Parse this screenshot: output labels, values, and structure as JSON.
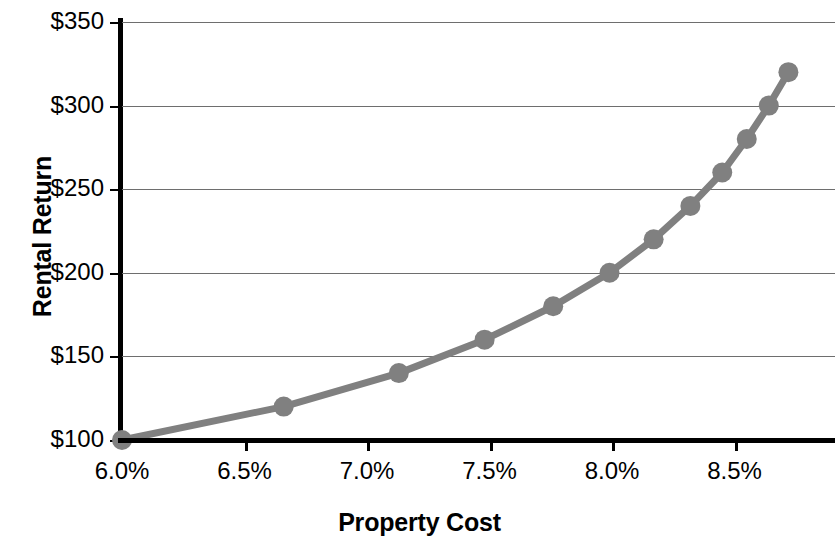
{
  "chart_data": {
    "type": "line",
    "title": "",
    "xlabel": "Property Cost",
    "ylabel": "Rental Return",
    "xlim": [
      5.85,
      8.85
    ],
    "ylim": [
      100,
      350
    ],
    "grid": true,
    "legend": false,
    "series_color": "#808080",
    "marker": "circle",
    "xticks": [
      "6.0%",
      "6.5%",
      "7.0%",
      "7.5%",
      "8.0%",
      "8.5%"
    ],
    "xtick_values": [
      6.0,
      6.5,
      7.0,
      7.5,
      8.0,
      8.5
    ],
    "yticks": [
      "$100",
      "$150",
      "$200",
      "$250",
      "$300",
      "$350"
    ],
    "ytick_values": [
      100,
      150,
      200,
      250,
      300,
      350
    ],
    "x": [
      6.0,
      6.66,
      7.13,
      7.48,
      7.76,
      7.99,
      8.17,
      8.32,
      8.45,
      8.55,
      8.64,
      8.72
    ],
    "values": [
      100,
      120,
      140,
      160,
      180,
      200,
      220,
      240,
      260,
      280,
      300,
      320
    ],
    "series": [
      {
        "name": "Rental Return",
        "color": "#808080",
        "points": [
          {
            "x": 6.0,
            "y": 100
          },
          {
            "x": 6.66,
            "y": 120
          },
          {
            "x": 7.13,
            "y": 140
          },
          {
            "x": 7.48,
            "y": 160
          },
          {
            "x": 7.76,
            "y": 180
          },
          {
            "x": 7.99,
            "y": 200
          },
          {
            "x": 8.17,
            "y": 220
          },
          {
            "x": 8.32,
            "y": 240
          },
          {
            "x": 8.45,
            "y": 260
          },
          {
            "x": 8.55,
            "y": 280
          },
          {
            "x": 8.64,
            "y": 300
          },
          {
            "x": 8.72,
            "y": 320
          }
        ]
      }
    ]
  }
}
